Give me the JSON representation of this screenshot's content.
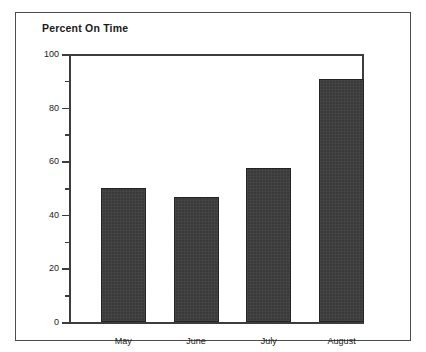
{
  "chart_data": {
    "type": "bar",
    "title": "Percent On Time",
    "xlabel": "",
    "ylabel": "",
    "categories": [
      "May",
      "June",
      "July",
      "August"
    ],
    "values": [
      50,
      46.5,
      57.5,
      90.5
    ],
    "ylim": [
      0,
      100
    ],
    "y_ticks_major": [
      0,
      20,
      40,
      60,
      80,
      100
    ],
    "y_tick_labels": [
      "0",
      "20",
      "40",
      "60",
      "80",
      "100"
    ],
    "y_ticks_minor": [
      10,
      30,
      50,
      70,
      90
    ],
    "grid": false,
    "legend": null,
    "bar_color": "#3a3a3a",
    "frame_color": "#4c4c4c"
  }
}
